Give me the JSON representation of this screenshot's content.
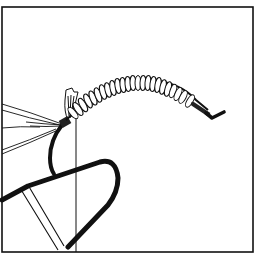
{
  "illustration": {
    "subject": "fly-tying hook with wrapped body and tail",
    "colors": {
      "ink": "#111111",
      "paper": "#ffffff"
    },
    "frame": {
      "x": 2,
      "y": 7,
      "width": 251,
      "height": 245
    },
    "elements": [
      {
        "name": "frame-border"
      },
      {
        "name": "hook-bend"
      },
      {
        "name": "hook-shank"
      },
      {
        "name": "hook-eye"
      },
      {
        "name": "wrapped-body"
      },
      {
        "name": "tail-fibers"
      },
      {
        "name": "wing-tuft"
      },
      {
        "name": "thread-line"
      },
      {
        "name": "vise-jaw"
      }
    ]
  }
}
